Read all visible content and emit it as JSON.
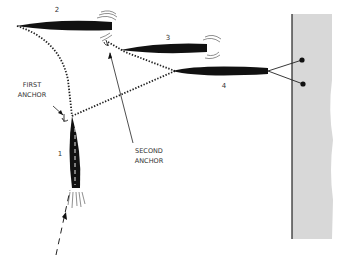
{
  "diagram": {
    "boats": [
      {
        "id": "1",
        "label": "1"
      },
      {
        "id": "2",
        "label": "2"
      },
      {
        "id": "3",
        "label": "3"
      },
      {
        "id": "4",
        "label": "4"
      }
    ],
    "labels": {
      "first_anchor_line1": "FIRST",
      "first_anchor_line2": "ANCHOR",
      "second_anchor_line1": "SECOND",
      "second_anchor_line2": "ANCHOR"
    },
    "colors": {
      "boat": "#111111",
      "wall": "#d6d6d6",
      "line": "#222222"
    }
  }
}
